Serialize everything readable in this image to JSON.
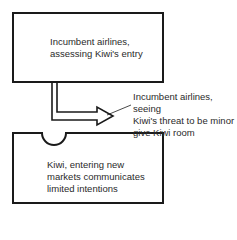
{
  "diagram": {
    "top_box": {
      "lines": [
        "Incumbent airlines,",
        "assessing Kiwi's entry"
      ]
    },
    "bottom_box": {
      "lines": [
        "Kiwi, entering new",
        "markets communicates",
        "limited intentions"
      ]
    },
    "annotation": {
      "lines": [
        "Incumbent airlines, seeing",
        "Kiwi's threat to be minor",
        "give Kiwi room"
      ]
    },
    "colors": {
      "stroke": "#1a1a1a",
      "background": "#ffffff"
    }
  }
}
